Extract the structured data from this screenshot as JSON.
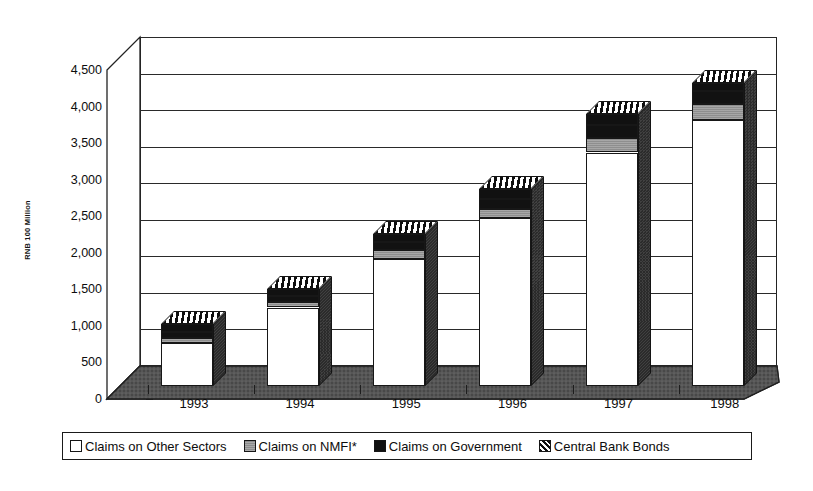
{
  "chart_data": {
    "type": "bar",
    "subtype": "stacked-column-3d",
    "title": "",
    "xlabel": "",
    "ylabel": "RNB 100 Million",
    "ylim": [
      0,
      4500
    ],
    "ytick_step": 500,
    "yticks": [
      "0",
      "500",
      "1,000",
      "1,500",
      "2,000",
      "2,500",
      "3,000",
      "3,500",
      "4,000",
      "4,500"
    ],
    "ytick_values": [
      0,
      500,
      1000,
      1500,
      2000,
      2500,
      3000,
      3500,
      4000,
      4500
    ],
    "grid": true,
    "legend_position": "bottom",
    "categories": [
      "1993",
      "1994",
      "1995",
      "1996",
      "1997",
      "1998"
    ],
    "series": [
      {
        "name": "Claims on Other Sectors",
        "color": "#ffffff",
        "pattern": "solid",
        "values": [
          600,
          1080,
          1750,
          2300,
          3200,
          3650
        ]
      },
      {
        "name": "Claims on NMFI*",
        "color": "#8e8e8e",
        "pattern": "solid-gray",
        "values": [
          60,
          70,
          110,
          130,
          200,
          210
        ]
      },
      {
        "name": "Claims on Government",
        "color": "#121212",
        "pattern": "solid-black",
        "values": [
          90,
          90,
          110,
          140,
          180,
          180
        ]
      },
      {
        "name": "Central Bank Bonds",
        "color": "#ffffff",
        "pattern": "diagonal-hatch",
        "values": [
          100,
          90,
          110,
          130,
          140,
          110
        ]
      }
    ],
    "totals": [
      850,
      1330,
      2080,
      2700,
      3720,
      4150
    ]
  },
  "axis": {
    "y_title": "RNB 100 Million"
  },
  "legend": {
    "items": [
      {
        "label": "Claims on Other Sectors",
        "swatch": "sw-other"
      },
      {
        "label": "Claims on NMFI*",
        "swatch": "sw-nmfi"
      },
      {
        "label": "Claims on Government",
        "swatch": "sw-gov"
      },
      {
        "label": "Central Bank Bonds",
        "swatch": "sw-bonds"
      }
    ]
  }
}
